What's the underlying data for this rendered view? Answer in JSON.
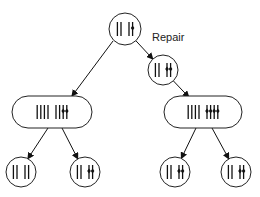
{
  "labels": {
    "repair": "Repair"
  },
  "nodes": [
    {
      "id": "root",
      "shape": "circle",
      "groups": [
        {
          "plain": 2
        },
        {
          "plain": 1,
          "marked": 1
        }
      ]
    },
    {
      "id": "repaired",
      "shape": "circle",
      "groups": [
        {
          "plain": 2
        },
        {
          "marked": 2
        }
      ]
    },
    {
      "id": "left-replicated",
      "shape": "capsule",
      "groups": [
        {
          "plain": 4
        },
        {
          "plain": 2,
          "marked": 2
        }
      ]
    },
    {
      "id": "right-replicated",
      "shape": "capsule",
      "groups": [
        {
          "plain": 4
        },
        {
          "marked": 4
        }
      ]
    },
    {
      "id": "left-left-child",
      "shape": "circle",
      "groups": [
        {
          "plain": 2
        },
        {
          "plain": 2
        }
      ]
    },
    {
      "id": "left-right-child",
      "shape": "circle",
      "groups": [
        {
          "plain": 2
        },
        {
          "marked": 2
        }
      ]
    },
    {
      "id": "right-left-child",
      "shape": "circle",
      "groups": [
        {
          "plain": 2
        },
        {
          "marked": 2
        }
      ]
    },
    {
      "id": "right-right-child",
      "shape": "circle",
      "groups": [
        {
          "plain": 2
        },
        {
          "marked": 2
        }
      ]
    }
  ],
  "edges": [
    {
      "from": "root",
      "to": "left-replicated"
    },
    {
      "from": "root",
      "to": "repaired"
    },
    {
      "from": "repaired",
      "to": "right-replicated"
    },
    {
      "from": "left-replicated",
      "to": "left-left-child"
    },
    {
      "from": "left-replicated",
      "to": "left-right-child"
    },
    {
      "from": "right-replicated",
      "to": "right-left-child"
    },
    {
      "from": "right-replicated",
      "to": "right-right-child"
    }
  ]
}
